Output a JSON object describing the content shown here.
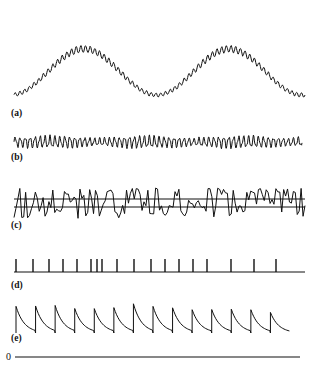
{
  "figure": {
    "background_color": "#ffffff",
    "stroke_color": "#111111",
    "width": 316,
    "height": 372,
    "zero_label": "0"
  },
  "panels": [
    {
      "id": "a",
      "label": "(a)",
      "label_x": 11,
      "label_y": 116,
      "description": "Slow two-cycle carrier envelope with fine high-frequency ripple superimposed",
      "x_start": 14,
      "x_end": 305,
      "baseline_y": 95,
      "amplitude": 46,
      "ripple_amplitude": 3.4,
      "ripple_cycles": 62,
      "slow_cycles": 2.0,
      "slow_phase": -1.45
    },
    {
      "id": "b",
      "label": "(b)",
      "label_x": 11,
      "label_y": 160,
      "description": "Dense low-amplitude oscillation with amplitude modulation bursts",
      "x_start": 14,
      "x_end": 302,
      "baseline_y": 142,
      "amplitude": 5.2,
      "ripple_cycles": 58,
      "modulation_cycles": 3.0
    },
    {
      "id": "c",
      "label": "(c)",
      "label_x": 11,
      "label_y": 228,
      "description": "Irregular random-walk waveform crossing two horizontal threshold lines",
      "x_start": 14,
      "x_end": 305,
      "baseline_y": 203,
      "amplitude": 15,
      "threshold_upper_y": 199,
      "threshold_lower_y": 207,
      "samples": 150
    },
    {
      "id": "d",
      "label": "(d)",
      "label_x": 11,
      "label_y": 288,
      "description": "Impulse (spike) train on a horizontal baseline",
      "x_start": 14,
      "x_end": 305,
      "baseline_y": 272,
      "spike_height": 13,
      "spike_positions": [
        16,
        33,
        49,
        63,
        77,
        91,
        97,
        102,
        117,
        134,
        151,
        165,
        179,
        193,
        207,
        231,
        254,
        276
      ]
    },
    {
      "id": "e",
      "label": "(e)",
      "label_x": 11,
      "label_y": 341,
      "description": "Sawtooth / integrate-and-fire ramp with exponential decay between resets",
      "x_start": 16,
      "x_end": 290,
      "baseline_y": 333,
      "peak_amplitude": 28,
      "teeth": 14
    }
  ],
  "zero_axis": {
    "label": "0",
    "label_x": 6,
    "label_y": 360,
    "x_start": 15,
    "x_end": 300,
    "y": 357
  }
}
